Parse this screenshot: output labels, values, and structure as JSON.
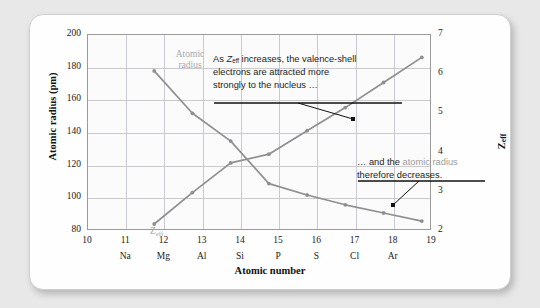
{
  "chart_data": {
    "type": "line",
    "title": "",
    "xlabel": "Atomic number",
    "ylabel_left": "Atomic radius (pm)",
    "ylabel_right": "Zeff",
    "x": [
      11,
      12,
      13,
      14,
      15,
      16,
      17,
      18
    ],
    "x_symbols": [
      "Na",
      "Mg",
      "Al",
      "Si",
      "P",
      "S",
      "Cl",
      "Ar"
    ],
    "xlim": [
      10,
      19
    ],
    "xticks": [
      10,
      11,
      12,
      13,
      14,
      15,
      16,
      17,
      18,
      19
    ],
    "ylim_left": [
      80,
      200
    ],
    "yticks_left": [
      80,
      100,
      120,
      140,
      160,
      180,
      200
    ],
    "ylim_right": [
      2,
      7
    ],
    "yticks_right": [
      2,
      3,
      4,
      5,
      6,
      7
    ],
    "grid": true,
    "legend_position": "inline-labels",
    "series": [
      {
        "name": "Atomic radius",
        "axis": "left",
        "color": "#8f8f8f",
        "values": [
          186,
          160,
          143,
          117,
          110,
          104,
          99,
          94
        ]
      },
      {
        "name": "Zeff",
        "axis": "right",
        "color": "#8f8f8f",
        "values": [
          2.51,
          3.31,
          4.07,
          4.29,
          4.89,
          5.48,
          6.12,
          6.76
        ]
      }
    ],
    "annotations": [
      {
        "id": "annot-increase",
        "lines": [
          "As Zeff increases, the valence-shell",
          "electrons are attracted more",
          "strongly to the nucleus …"
        ],
        "line1_pre": "As ",
        "line1_var": "Z",
        "line1_sub": "eff",
        "line1_post": " increases, the valence-shell",
        "line2": "electrons are attracted more",
        "line3": "strongly to the nucleus …",
        "points_to": "Zeff curve"
      },
      {
        "id": "annot-decrease",
        "line1_pre": "… and the ",
        "line1_hl": "atomic radius",
        "line2": "therefore decreases.",
        "points_to": "Atomic radius curve"
      }
    ],
    "series_labels": {
      "atomic_radius_line1": "Atomic",
      "atomic_radius_line2": "radius",
      "zeff_var": "Z",
      "zeff_sub": "eff"
    }
  },
  "axes": {
    "left_title_main": "Atomic radius (pm)",
    "right_title_var": "Z",
    "right_title_sub": "eff",
    "x_title": "Atomic number",
    "yticks_left": [
      "200",
      "180",
      "160",
      "140",
      "120",
      "100",
      "80"
    ],
    "yticks_right": [
      "7",
      "6",
      "5",
      "4",
      "3",
      "2"
    ],
    "xticks": [
      "10",
      "11",
      "12",
      "13",
      "14",
      "15",
      "16",
      "17",
      "18",
      "19"
    ],
    "xsymbols": [
      "",
      "Na",
      "Mg",
      "Al",
      "Si",
      "P",
      "S",
      "Cl",
      "Ar",
      ""
    ]
  },
  "colors": {
    "series": "#8f8f8f",
    "grid": "#c9c9d2",
    "frame": "#9a9a9a",
    "annotation_text": "#1b1b1b",
    "highlight_gray": "#9d9d9d",
    "page_background": "#e8e8e8",
    "card_background": "#fefefe"
  }
}
